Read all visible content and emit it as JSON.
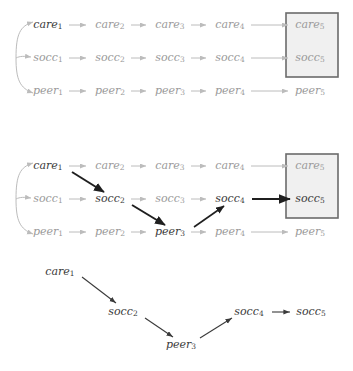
{
  "figure": {
    "states": [
      "care",
      "socc",
      "peer"
    ],
    "stages": [
      1,
      2,
      3,
      4,
      5
    ],
    "colors": {
      "faded_text": "#9a9a9a",
      "dark_text": "#3a3a3a",
      "faded_arrow": "#bcbcbc",
      "dark_arrow": "#1f1f1f",
      "box_fill": "#f0f0f0",
      "box_stroke": "#6b6b6b",
      "background": "#ffffff"
    }
  },
  "panels": [
    {
      "id": "panel-top",
      "name": "full-trellis",
      "nodes": [
        {
          "id": "care1",
          "base": "care",
          "sub": "1",
          "x": 48,
          "y": 25,
          "emphasis": "dark"
        },
        {
          "id": "care2",
          "base": "care",
          "sub": "2",
          "x": 110,
          "y": 25,
          "emphasis": "faded"
        },
        {
          "id": "care3",
          "base": "care",
          "sub": "3",
          "x": 170,
          "y": 25,
          "emphasis": "faded"
        },
        {
          "id": "care4",
          "base": "care",
          "sub": "4",
          "x": 230,
          "y": 25,
          "emphasis": "faded"
        },
        {
          "id": "care5",
          "base": "care",
          "sub": "5",
          "x": 310,
          "y": 25,
          "emphasis": "faded"
        },
        {
          "id": "socc1",
          "base": "socc",
          "sub": "1",
          "x": 48,
          "y": 58,
          "emphasis": "faded"
        },
        {
          "id": "socc2",
          "base": "socc",
          "sub": "2",
          "x": 110,
          "y": 58,
          "emphasis": "faded"
        },
        {
          "id": "socc3",
          "base": "socc",
          "sub": "3",
          "x": 170,
          "y": 58,
          "emphasis": "faded"
        },
        {
          "id": "socc4",
          "base": "socc",
          "sub": "4",
          "x": 230,
          "y": 58,
          "emphasis": "faded"
        },
        {
          "id": "socc5",
          "base": "socc",
          "sub": "5",
          "x": 310,
          "y": 58,
          "emphasis": "faded"
        },
        {
          "id": "peer1",
          "base": "peer",
          "sub": "1",
          "x": 48,
          "y": 91,
          "emphasis": "faded"
        },
        {
          "id": "peer2",
          "base": "peer",
          "sub": "2",
          "x": 110,
          "y": 91,
          "emphasis": "faded"
        },
        {
          "id": "peer3",
          "base": "peer",
          "sub": "3",
          "x": 170,
          "y": 91,
          "emphasis": "faded"
        },
        {
          "id": "peer4",
          "base": "peer",
          "sub": "4",
          "x": 230,
          "y": 91,
          "emphasis": "faded"
        },
        {
          "id": "peer5",
          "base": "peer",
          "sub": "5",
          "x": 310,
          "y": 91,
          "emphasis": "faded"
        }
      ],
      "highlight_box": {
        "x": 286,
        "y": 13,
        "width": 52,
        "height": 64
      },
      "dark_edges": []
    },
    {
      "id": "panel-middle",
      "name": "trellis-with-path",
      "nodes": [
        {
          "id": "care1",
          "base": "care",
          "sub": "1",
          "x": 48,
          "y": 166,
          "emphasis": "dark"
        },
        {
          "id": "care2",
          "base": "care",
          "sub": "2",
          "x": 110,
          "y": 166,
          "emphasis": "faded"
        },
        {
          "id": "care3",
          "base": "care",
          "sub": "3",
          "x": 170,
          "y": 166,
          "emphasis": "faded"
        },
        {
          "id": "care4",
          "base": "care",
          "sub": "4",
          "x": 230,
          "y": 166,
          "emphasis": "faded"
        },
        {
          "id": "care5",
          "base": "care",
          "sub": "5",
          "x": 310,
          "y": 166,
          "emphasis": "faded"
        },
        {
          "id": "socc1",
          "base": "socc",
          "sub": "1",
          "x": 48,
          "y": 199,
          "emphasis": "faded"
        },
        {
          "id": "socc2",
          "base": "socc",
          "sub": "2",
          "x": 110,
          "y": 199,
          "emphasis": "dark"
        },
        {
          "id": "socc3",
          "base": "socc",
          "sub": "3",
          "x": 170,
          "y": 199,
          "emphasis": "faded"
        },
        {
          "id": "socc4",
          "base": "socc",
          "sub": "4",
          "x": 230,
          "y": 199,
          "emphasis": "dark"
        },
        {
          "id": "socc5",
          "base": "socc",
          "sub": "5",
          "x": 310,
          "y": 199,
          "emphasis": "dark"
        },
        {
          "id": "peer1",
          "base": "peer",
          "sub": "1",
          "x": 48,
          "y": 232,
          "emphasis": "faded"
        },
        {
          "id": "peer2",
          "base": "peer",
          "sub": "2",
          "x": 110,
          "y": 232,
          "emphasis": "faded"
        },
        {
          "id": "peer3",
          "base": "peer",
          "sub": "3",
          "x": 170,
          "y": 232,
          "emphasis": "dark"
        },
        {
          "id": "peer4",
          "base": "peer",
          "sub": "4",
          "x": 230,
          "y": 232,
          "emphasis": "faded"
        },
        {
          "id": "peer5",
          "base": "peer",
          "sub": "5",
          "x": 310,
          "y": 232,
          "emphasis": "faded"
        }
      ],
      "highlight_box": {
        "x": 286,
        "y": 154,
        "width": 52,
        "height": 64
      },
      "dark_edges": [
        {
          "from": "care1",
          "to": "socc2"
        },
        {
          "from": "socc2",
          "to": "peer3"
        },
        {
          "from": "peer3",
          "to": "socc4"
        },
        {
          "from": "socc4",
          "to": "socc5"
        }
      ]
    },
    {
      "id": "panel-bottom",
      "name": "extracted-path",
      "nodes": [
        {
          "id": "care1",
          "base": "care",
          "sub": "1",
          "x": 60,
          "y": 272,
          "emphasis": "dark"
        },
        {
          "id": "socc2",
          "base": "socc",
          "sub": "2",
          "x": 123,
          "y": 312,
          "emphasis": "dark"
        },
        {
          "id": "peer3",
          "base": "peer",
          "sub": "3",
          "x": 181,
          "y": 345,
          "emphasis": "dark"
        },
        {
          "id": "socc4",
          "base": "socc",
          "sub": "4",
          "x": 249,
          "y": 312,
          "emphasis": "dark"
        },
        {
          "id": "socc5",
          "base": "socc",
          "sub": "5",
          "x": 311,
          "y": 312,
          "emphasis": "dark"
        }
      ],
      "highlight_box": null,
      "dark_edges": [
        {
          "from": "care1",
          "to": "socc2"
        },
        {
          "from": "socc2",
          "to": "peer3"
        },
        {
          "from": "peer3",
          "to": "socc4"
        },
        {
          "from": "socc4",
          "to": "socc5"
        }
      ]
    }
  ],
  "path_sequence": [
    "care1",
    "socc2",
    "peer3",
    "socc4",
    "socc5"
  ]
}
